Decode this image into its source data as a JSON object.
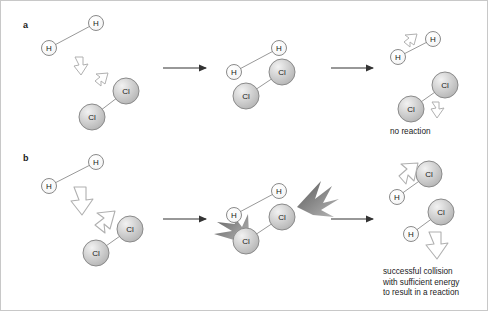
{
  "figure": {
    "background_color": "#ffffff",
    "border_color": "#c8c8c8"
  },
  "panels": [
    {
      "id": "a",
      "label": "a",
      "outcome_caption": "no reaction",
      "description": "Low energy collision between a hydrogen molecule and a chlorine molecule; molecules bounce apart unchanged.",
      "energy_level": "insufficient",
      "stages": [
        {
          "name": "approach",
          "molecules": [
            {
              "formula": "H2",
              "atoms": [
                "H",
                "H"
              ]
            },
            {
              "formula": "Cl2",
              "atoms": [
                "Cl",
                "Cl"
              ]
            }
          ],
          "motion_arrows": 2,
          "motion_arrow_size": "small"
        },
        {
          "name": "collision",
          "molecules": [
            {
              "formula": "H2",
              "atoms": [
                "H",
                "H"
              ]
            },
            {
              "formula": "Cl2",
              "atoms": [
                "Cl",
                "Cl"
              ]
            }
          ],
          "sparks": 0
        },
        {
          "name": "products",
          "molecules": [
            {
              "formula": "H2",
              "atoms": [
                "H",
                "H"
              ]
            },
            {
              "formula": "Cl2",
              "atoms": [
                "Cl",
                "Cl"
              ]
            }
          ],
          "motion_arrows": 2,
          "motion_arrow_size": "small"
        }
      ]
    },
    {
      "id": "b",
      "label": "b",
      "outcome_caption": "successful collision\nwith sufficient energy\nto result in a reaction",
      "outcome_caption_lines": [
        "successful collision",
        "with sufficient energy",
        "to result in a reaction"
      ],
      "description": "High energy collision between a hydrogen molecule and a chlorine molecule producing two hydrogen chloride molecules.",
      "energy_level": "sufficient",
      "stages": [
        {
          "name": "approach",
          "molecules": [
            {
              "formula": "H2",
              "atoms": [
                "H",
                "H"
              ]
            },
            {
              "formula": "Cl2",
              "atoms": [
                "Cl",
                "Cl"
              ]
            }
          ],
          "motion_arrows": 2,
          "motion_arrow_size": "large"
        },
        {
          "name": "collision",
          "molecules": [
            {
              "formula": "H2",
              "atoms": [
                "H",
                "H"
              ]
            },
            {
              "formula": "Cl2",
              "atoms": [
                "Cl",
                "Cl"
              ]
            }
          ],
          "sparks": 2
        },
        {
          "name": "products",
          "molecules": [
            {
              "formula": "HCl",
              "atoms": [
                "H",
                "Cl"
              ]
            },
            {
              "formula": "HCl",
              "atoms": [
                "H",
                "Cl"
              ]
            }
          ],
          "motion_arrows": 2,
          "motion_arrow_size": "large"
        }
      ]
    }
  ],
  "atom_styles": {
    "H": {
      "symbol": "H",
      "radius": 7.5,
      "fill": "#ffffff",
      "stroke": "#808080"
    },
    "Cl": {
      "symbol": "Cl",
      "radius": 13,
      "fill": "#cccccc",
      "stroke": "#808080"
    }
  },
  "reaction_arrows": {
    "count": 4,
    "color": "#333333",
    "style": "straight-right"
  },
  "spark_color": "#777777",
  "motion_arrow_style": {
    "fill": "#ffffff",
    "stroke": "#aaaaaa"
  }
}
